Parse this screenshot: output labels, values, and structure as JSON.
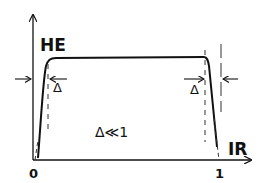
{
  "diagram": {
    "y_axis_label": "HE",
    "x_axis_label": "IR",
    "x_tick_origin": "0",
    "x_tick_end": "1",
    "delta_left": "Δ",
    "delta_right": "Δ",
    "annotation": "Δ≪1",
    "colors": {
      "line": "#111111",
      "dashed": "#333333",
      "background": "#ffffff"
    }
  }
}
